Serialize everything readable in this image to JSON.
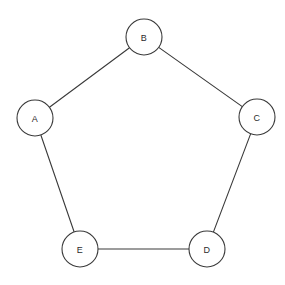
{
  "diagram": {
    "type": "undirected-graph",
    "background_color": "#ffffff",
    "stroke_color": "#3a3a3a",
    "label_color": "#2b2b2b",
    "node_fill": "#ffffff",
    "node_radius": 18,
    "stroke_width": 1.1,
    "nodes": [
      {
        "id": "A",
        "label": "A",
        "cx": 35,
        "cy": 118
      },
      {
        "id": "B",
        "label": "B",
        "cx": 144,
        "cy": 37
      },
      {
        "id": "C",
        "label": "C",
        "cx": 257,
        "cy": 117
      },
      {
        "id": "D",
        "label": "D",
        "cx": 207,
        "cy": 249
      },
      {
        "id": "E",
        "label": "E",
        "cx": 80,
        "cy": 249
      }
    ],
    "edges": [
      {
        "from": "A",
        "to": "B"
      },
      {
        "from": "B",
        "to": "C"
      },
      {
        "from": "C",
        "to": "D"
      },
      {
        "from": "D",
        "to": "E"
      },
      {
        "from": "E",
        "to": "A"
      }
    ]
  }
}
